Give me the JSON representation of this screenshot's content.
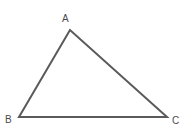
{
  "figure": {
    "kind": "geometry-diagram",
    "shape": "triangle",
    "background_color": "#ffffff",
    "stroke_color": "#5a5a5a",
    "stroke_width": 2,
    "label_color": "#4a4a4a",
    "canvas": {
      "width": 187,
      "height": 133
    },
    "vertices": [
      {
        "name": "A",
        "label": "A",
        "x": 70,
        "y": 30,
        "label_x": 62,
        "label_y": 14
      },
      {
        "name": "B",
        "label": "B",
        "x": 19,
        "y": 117,
        "label_x": 5,
        "label_y": 115
      },
      {
        "name": "C",
        "label": "C",
        "x": 167,
        "y": 117,
        "label_x": 172,
        "label_y": 116
      }
    ],
    "edges": [
      {
        "name": "side-AB",
        "from": "A",
        "to": "B"
      },
      {
        "name": "side-BC",
        "from": "B",
        "to": "C"
      },
      {
        "name": "side-CA",
        "from": "C",
        "to": "A"
      }
    ],
    "polygon_points": "70,30 19,117 167,117"
  }
}
